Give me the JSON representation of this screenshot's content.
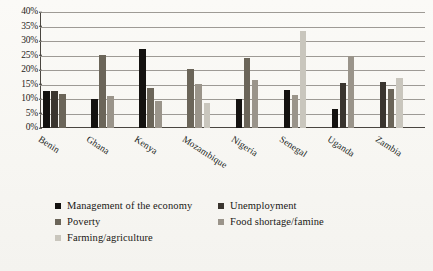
{
  "chart_data": {
    "type": "bar",
    "title": "",
    "xlabel": "",
    "ylabel": "",
    "ylim": [
      0,
      40
    ],
    "ytick_labels": [
      "40%",
      "35%",
      "30%",
      "25%",
      "20%",
      "15%",
      "10%",
      "5%",
      "0%"
    ],
    "ytick_values": [
      40,
      35,
      30,
      25,
      20,
      15,
      10,
      5,
      0
    ],
    "grid": true,
    "legend_position": "bottom",
    "categories": [
      "Benin",
      "Ghana",
      "Kenya",
      "Mozambique",
      "Nigeria",
      "Senegal",
      "Uganda",
      "Zambia"
    ],
    "series": [
      {
        "name": "Management of the economy",
        "color": "#141210",
        "values": [
          12.7,
          10.0,
          27.2,
          null,
          9.9,
          13.1,
          6.5,
          null
        ]
      },
      {
        "name": "Unemployment",
        "color": "#3a352f",
        "values": [
          12.7,
          null,
          null,
          null,
          null,
          null,
          15.4,
          15.9
        ]
      },
      {
        "name": "Poverty",
        "color": "#6b6559",
        "values": [
          11.7,
          25.3,
          13.7,
          20.4,
          24.0,
          null,
          null,
          13.4
        ]
      },
      {
        "name": "Food shortage/famine",
        "color": "#9a948a",
        "values": [
          null,
          11.0,
          9.2,
          15.2,
          16.7,
          11.5,
          24.9,
          null
        ]
      },
      {
        "name": "Farming/agriculture",
        "color": "#c9c6bd",
        "values": [
          null,
          null,
          null,
          8.6,
          null,
          33.4,
          null,
          17.4
        ]
      }
    ]
  },
  "legend": {
    "rows": [
      [
        {
          "label": "Management of the economy",
          "color": "#141210",
          "icon": "legend-swatch-icon"
        },
        {
          "label": "Unemployment",
          "color": "#3a352f",
          "icon": "legend-swatch-icon"
        }
      ],
      [
        {
          "label": "Poverty",
          "color": "#6b6559",
          "icon": "legend-swatch-icon"
        },
        {
          "label": "Food shortage/famine",
          "color": "#9a948a",
          "icon": "legend-swatch-icon"
        }
      ],
      [
        {
          "label": "Farming/agriculture",
          "color": "#c9c6bd",
          "icon": "legend-swatch-icon"
        }
      ]
    ]
  }
}
